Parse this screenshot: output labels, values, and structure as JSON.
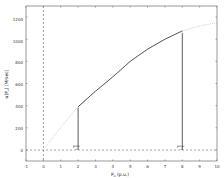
{
  "chart_data": {
    "type": "line",
    "title": "",
    "xlabel": "P_u (p.u.)",
    "ylabel": "u(P_u) [M/sec]",
    "xlim": [
      -1,
      10
    ],
    "ylim": [
      -100,
      1300
    ],
    "xticks": [
      -1,
      0,
      1,
      2,
      3,
      4,
      5,
      6,
      7,
      8,
      9,
      10
    ],
    "yticks": [
      0,
      200,
      400,
      600,
      800,
      1000,
      1200
    ],
    "grid": false,
    "legend": null,
    "series": [
      {
        "name": "utility (dotted, full range)",
        "style": "dotted",
        "color": "#aaaaaa",
        "x": [
          0,
          1,
          2,
          3,
          4,
          5,
          6,
          7,
          8,
          9,
          10
        ],
        "y": [
          0,
          205,
          390,
          530,
          660,
          800,
          910,
          1000,
          1075,
          1120,
          1150
        ]
      },
      {
        "name": "utility (solid, feasible range)",
        "style": "solid",
        "color": "#333333",
        "x": [
          2,
          3,
          4,
          5,
          6,
          7,
          8
        ],
        "y": [
          390,
          530,
          660,
          800,
          910,
          1000,
          1075
        ]
      }
    ],
    "reference_lines": [
      {
        "orientation": "vertical",
        "x": 0,
        "style": "dashed"
      },
      {
        "orientation": "horizontal",
        "y": 0,
        "style": "dashed"
      },
      {
        "orientation": "vertical",
        "x": 2,
        "y_from": 0,
        "y_to": 390,
        "style": "solid"
      },
      {
        "orientation": "vertical",
        "x": 8,
        "y_from": 0,
        "y_to": 1075,
        "style": "solid"
      }
    ],
    "annotations": [
      {
        "text": "P_u^min",
        "x": 2,
        "y": 0
      },
      {
        "text": "P_u^max",
        "x": 8,
        "y": 0
      }
    ]
  },
  "labels": {
    "xlabel_main": "P",
    "xlabel_sub": "u",
    "xlabel_unit": " (p.u.)",
    "ylabel": "u(P",
    "ylabel_sub": "u",
    "ylabel_rest": ") [M/sec]",
    "pmin_main": "P",
    "pmin_sub": "u",
    "pmin_sup": "min",
    "pmax_main": "P",
    "pmax_sub": "u",
    "pmax_sup": "max"
  },
  "ticks": {
    "x": [
      "-1",
      "0",
      "1",
      "2",
      "3",
      "4",
      "5",
      "6",
      "7",
      "8",
      "9",
      "10"
    ],
    "y": [
      "0",
      "200",
      "400",
      "600",
      "800",
      "1000",
      "1200"
    ]
  }
}
